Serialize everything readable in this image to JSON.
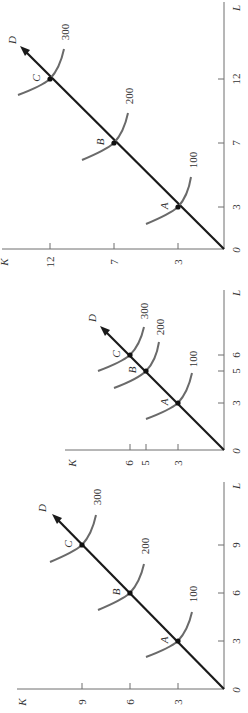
{
  "figure": {
    "orientation": "rotated 90 degrees counter-clockwise",
    "colors": {
      "ray": "#1a1a1a",
      "isoquant": "#6a6a6a",
      "axis": "#6f6f6f",
      "text": "#333333"
    }
  },
  "panels": [
    {
      "id": "top",
      "axis_labels": {
        "x": "L",
        "y": "K",
        "origin": "0"
      },
      "x_ticks": [
        "3",
        "7",
        "12"
      ],
      "y_ticks": [
        "3",
        "7",
        "12"
      ],
      "ray_label": "D",
      "points": [
        {
          "label": "A",
          "L": 3,
          "K": 3,
          "isoquant": "100"
        },
        {
          "label": "B",
          "L": 7,
          "K": 7,
          "isoquant": "200"
        },
        {
          "label": "C",
          "L": 12,
          "K": 12,
          "isoquant": "300"
        }
      ]
    },
    {
      "id": "middle",
      "axis_labels": {
        "x": "L",
        "y": "K",
        "origin": "0"
      },
      "x_ticks": [
        "3",
        "5",
        "6"
      ],
      "y_ticks": [
        "3",
        "5",
        "6"
      ],
      "ray_label": "D",
      "points": [
        {
          "label": "A",
          "L": 3,
          "K": 3,
          "isoquant": "100"
        },
        {
          "label": "B",
          "L": 5,
          "K": 5,
          "isoquant": "200"
        },
        {
          "label": "C",
          "L": 6,
          "K": 6,
          "isoquant": "300"
        }
      ]
    },
    {
      "id": "bottom",
      "axis_labels": {
        "x": "L",
        "y": "K",
        "origin": "0"
      },
      "x_ticks": [
        "3",
        "6",
        "9"
      ],
      "y_ticks": [
        "3",
        "6",
        "9"
      ],
      "ray_label": "D",
      "points": [
        {
          "label": "A",
          "L": 3,
          "K": 3,
          "isoquant": "100"
        },
        {
          "label": "B",
          "L": 6,
          "K": 6,
          "isoquant": "200"
        },
        {
          "label": "C",
          "L": 9,
          "K": 9,
          "isoquant": "300"
        }
      ]
    }
  ]
}
